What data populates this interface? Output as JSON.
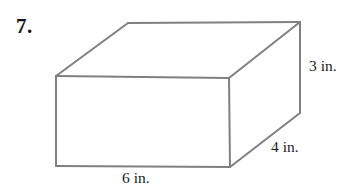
{
  "figure": {
    "problem_number": "7.",
    "shape_type": "rectangular prism",
    "line_color": "#808080",
    "text_color": "#1c1c1c",
    "background_color": "#ffffff",
    "dimension_labels": {
      "height": "3 in.",
      "depth": "4 in.",
      "width": "6 in."
    },
    "geometry": {
      "front_face": "56,76 229,78 230,167 56,166",
      "top_face": "56,76 128,23 300,22 229,78",
      "right_face": "229,78 300,22 300,113 230,167"
    }
  }
}
